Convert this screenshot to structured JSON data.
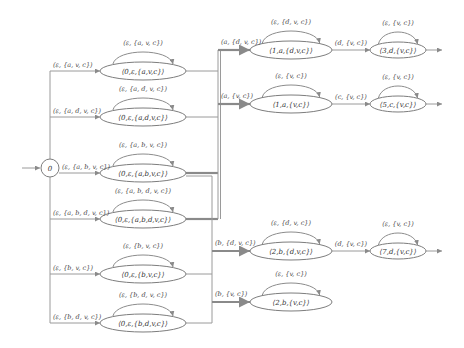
{
  "diagram": {
    "type": "state-transition-automaton",
    "start_node": {
      "id": "s0",
      "label": "0"
    },
    "nodes": [
      {
        "id": "n1",
        "label": "⟨0,ε,{a,v,c}⟩",
        "self_loop": "(ε, {a, v, c})",
        "in_edge": "(ε, {a, v, c})"
      },
      {
        "id": "n2",
        "label": "⟨0,ε,{a,d,v,c}⟩",
        "self_loop": "(ε, {a, d, v, c})",
        "in_edge": "(ε, {a, d, v, c})"
      },
      {
        "id": "n3",
        "label": "⟨0,ε,{a,b,v,c}⟩",
        "self_loop": "(ε, {a, b, v, c})",
        "in_edge": "(ε, {a, b, v, c})"
      },
      {
        "id": "n4",
        "label": "⟨0,ε,{a,b,d,v,c}⟩",
        "self_loop": "(ε, {a, b, d, v, c})",
        "in_edge": "(ε, {a, b, d, v, c})"
      },
      {
        "id": "n5",
        "label": "⟨0,ε,{b,v,c}⟩",
        "self_loop": "(ε, {b, v, c})",
        "in_edge": "(ε, {b, v, c})"
      },
      {
        "id": "n6",
        "label": "⟨0,ε,{b,d,v,c}⟩",
        "self_loop": "(ε, {b, d, v, c})",
        "in_edge": "(ε, {b, d, v, c})"
      },
      {
        "id": "m1",
        "label": "⟨1,a,{d,v,c}⟩",
        "self_loop": "(ε, {d, v, c})",
        "in_edge": "(a, {d, v, c})"
      },
      {
        "id": "m2",
        "label": "⟨1,a,{v,c}⟩",
        "self_loop": "(ε, {v, c})",
        "in_edge": "(a, {v, c})"
      },
      {
        "id": "m3",
        "label": "⟨2,b,{d,v,c}⟩",
        "self_loop": "(ε, {d, v, c})",
        "in_edge": "(b, {d, v, c})"
      },
      {
        "id": "m4",
        "label": "⟨2,b,{v,c}⟩",
        "self_loop": "(ε, {v, c})",
        "in_edge": "(b, {v, c})"
      },
      {
        "id": "r1",
        "label": "⟨3,d,{v,c}⟩",
        "self_loop": "(ε, {v, c})",
        "in_edge": "(d, {v, c})"
      },
      {
        "id": "r2",
        "label": "⟨5,c,{v,c}⟩",
        "self_loop": "(ε, {v, c})",
        "in_edge": "(c, {v, c})"
      },
      {
        "id": "r3",
        "label": "⟨7,d,{v,c}⟩",
        "self_loop": "(ε, {v, c})",
        "in_edge": "(d, {v, c})"
      }
    ],
    "edges": [
      {
        "from": "s0",
        "to": "n1"
      },
      {
        "from": "s0",
        "to": "n2"
      },
      {
        "from": "s0",
        "to": "n3"
      },
      {
        "from": "s0",
        "to": "n4"
      },
      {
        "from": "s0",
        "to": "n5"
      },
      {
        "from": "s0",
        "to": "n6"
      },
      {
        "from": "n1",
        "to": "m1"
      },
      {
        "from": "n2",
        "to": "m1"
      },
      {
        "from": "n3",
        "to": "m1"
      },
      {
        "from": "n4",
        "to": "m1"
      },
      {
        "from": "n1",
        "to": "m2"
      },
      {
        "from": "n2",
        "to": "m2"
      },
      {
        "from": "n3",
        "to": "m2"
      },
      {
        "from": "n4",
        "to": "m2"
      },
      {
        "from": "n3",
        "to": "m3"
      },
      {
        "from": "n4",
        "to": "m3"
      },
      {
        "from": "n5",
        "to": "m3"
      },
      {
        "from": "n6",
        "to": "m3"
      },
      {
        "from": "n3",
        "to": "m4"
      },
      {
        "from": "n4",
        "to": "m4"
      },
      {
        "from": "n5",
        "to": "m4"
      },
      {
        "from": "n6",
        "to": "m4"
      },
      {
        "from": "m1",
        "to": "r1"
      },
      {
        "from": "m2",
        "to": "r2"
      },
      {
        "from": "m3",
        "to": "r3"
      }
    ],
    "exits": [
      "r1",
      "r2",
      "r3"
    ]
  }
}
